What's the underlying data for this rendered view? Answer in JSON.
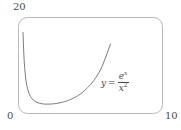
{
  "figure": {
    "background_color": "#ffffff",
    "frame_color": "#b9b9b9",
    "curve_color": "#6e6e6e",
    "text_color": "#4a4a4a"
  },
  "labels": {
    "y_max": "20",
    "origin": "0",
    "x_max": "10"
  },
  "equation": {
    "lhs": "y",
    "equals": "=",
    "numerator_base": "e",
    "numerator_exponent": "x",
    "denominator_base": "x",
    "denominator_exponent": "2",
    "plain": "y = e^x / x^2"
  },
  "chart_data": {
    "type": "line",
    "title": "",
    "xlabel": "",
    "ylabel": "",
    "xlim": [
      0,
      10
    ],
    "ylim": [
      0,
      20
    ],
    "grid": false,
    "legend": null,
    "annotations": [
      {
        "text": "y = e^x / x^2",
        "x": 6.0,
        "y": 6.2
      }
    ],
    "tick_labels": {
      "x": [
        "0",
        "10"
      ],
      "y": [
        "0",
        "20"
      ]
    },
    "series": [
      {
        "name": "y = e^x/x^2",
        "formula": "e^x / x^2",
        "x": [
          0.28,
          0.32,
          0.36,
          0.4,
          0.45,
          0.5,
          0.55,
          0.6,
          0.7,
          0.8,
          0.9,
          1.0,
          1.2,
          1.4,
          1.6,
          1.8,
          2.0,
          2.2,
          2.4,
          2.6,
          2.8,
          3.0,
          3.2,
          3.4,
          3.6,
          3.8,
          4.0,
          4.2,
          4.4,
          4.6,
          4.8,
          5.0,
          5.2,
          5.4,
          5.6,
          5.8,
          6.0,
          6.2,
          6.4
        ],
        "y": [
          16.87,
          13.45,
          11.06,
          9.32,
          7.75,
          6.59,
          5.73,
          5.07,
          4.11,
          3.48,
          3.04,
          2.72,
          2.31,
          2.07,
          1.93,
          1.86,
          1.85,
          1.87,
          1.92,
          1.99,
          2.1,
          2.23,
          2.4,
          2.59,
          2.82,
          3.09,
          3.41,
          3.79,
          4.23,
          4.73,
          5.31,
          5.94,
          6.7,
          7.53,
          8.52,
          9.65,
          11.21,
          12.8,
          14.45
        ],
        "color": "#6e6e6e",
        "linewidth": 0.9,
        "minimum": {
          "x": 2.0,
          "y": 1.85
        },
        "asymptote": "x = 0 (vertical)"
      }
    ]
  }
}
